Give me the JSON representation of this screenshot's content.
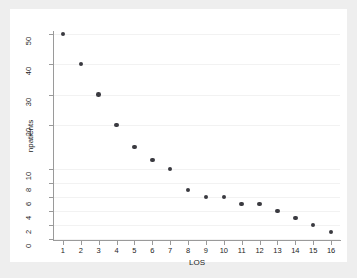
{
  "chart_data": {
    "type": "scatter",
    "title": "",
    "xlabel": "LOS",
    "ylabel": "npatients",
    "x": [
      1,
      2,
      3,
      4,
      5,
      6,
      7,
      8,
      9,
      10,
      11,
      12,
      13,
      14,
      15,
      16
    ],
    "values": [
      50,
      40,
      30,
      20,
      15,
      12,
      10,
      7,
      6,
      6,
      5,
      5,
      4,
      3,
      2,
      1
    ],
    "series": [
      {
        "name": "npatients",
        "values": [
          50,
          40,
          30,
          20,
          15,
          12,
          10,
          7,
          6,
          6,
          5,
          5,
          4,
          3,
          2,
          1
        ]
      }
    ],
    "xticks": [
      "1",
      "2",
      "3",
      "4",
      "5",
      "6",
      "7",
      "8",
      "9",
      "10",
      "11",
      "12",
      "13",
      "14",
      "15",
      "16"
    ],
    "xtick_values": [
      1,
      2,
      3,
      4,
      5,
      6,
      7,
      8,
      9,
      10,
      11,
      12,
      13,
      14,
      15,
      16
    ],
    "yticks": [
      "0",
      "2",
      "4",
      "6",
      "8",
      "10",
      "20",
      "30",
      "40",
      "50"
    ],
    "ytick_values": [
      0,
      2,
      4,
      6,
      8,
      10,
      20,
      30,
      40,
      50
    ],
    "xlim": [
      0.5,
      16.5
    ],
    "ylim": [
      0,
      52
    ],
    "grid": true,
    "grid_axis": "y",
    "legend": "none",
    "marker_color": "#3a3a40",
    "grid_color": "#f2f2f2",
    "axis_color": "#9a9a9a",
    "background": "#ffffff",
    "figure_background": "#eeeeee"
  }
}
